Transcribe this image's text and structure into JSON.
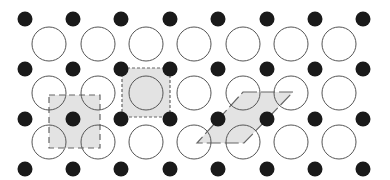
{
  "diagram": {
    "width": 390,
    "height": 180,
    "colors": {
      "background": "#ffffff",
      "black_atom": "#1a1a1a",
      "open_atom_stroke": "#555555",
      "cell_fill": "#e3e3e3",
      "cell_stroke": "#666666"
    },
    "black_atoms": {
      "radius": 7.5,
      "xs": [
        25,
        73,
        121,
        170,
        218,
        267,
        315,
        363
      ],
      "ys": [
        19,
        69,
        119,
        169
      ]
    },
    "open_atoms": {
      "radius": 17,
      "xs": [
        49,
        98,
        146,
        194,
        243,
        291,
        339
      ],
      "ys": [
        44,
        93,
        142
      ]
    },
    "unit_cells": [
      {
        "name": "square-cell-centered-black",
        "points": [
          [
            49,
            95
          ],
          [
            100,
            95
          ],
          [
            100,
            148
          ],
          [
            49,
            148
          ]
        ],
        "dash": "6 4"
      },
      {
        "name": "square-cell-centered-open",
        "points": [
          [
            122,
            68
          ],
          [
            170,
            68
          ],
          [
            170,
            117
          ],
          [
            122,
            117
          ]
        ],
        "dash": "3 2"
      },
      {
        "name": "rhombic-cell",
        "points": [
          [
            243,
            92
          ],
          [
            293,
            92
          ],
          [
            244,
            143
          ],
          [
            197,
            143
          ]
        ],
        "dash": "14 4"
      }
    ]
  }
}
